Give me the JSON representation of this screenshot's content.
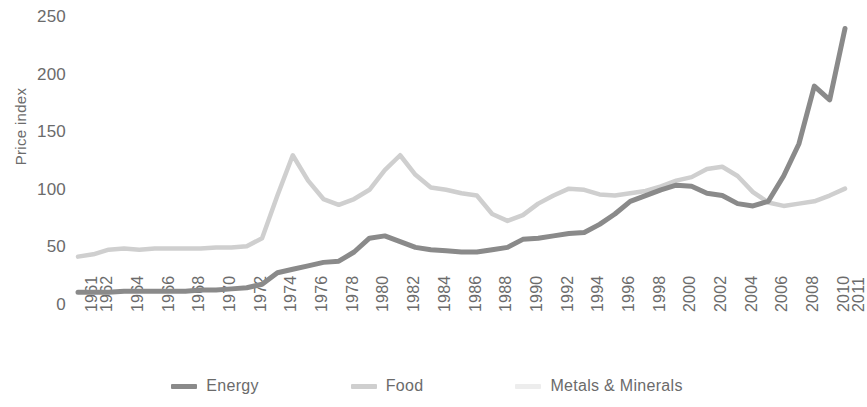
{
  "chart_data": {
    "type": "line",
    "title": "",
    "xlabel": "",
    "ylabel": "Price index",
    "ylim": [
      0,
      250
    ],
    "yticks": [
      0,
      50,
      100,
      150,
      200,
      250
    ],
    "grid": false,
    "legend_position": "bottom",
    "x": [
      1961,
      1962,
      1963,
      1964,
      1965,
      1966,
      1967,
      1968,
      1969,
      1970,
      1971,
      1972,
      1973,
      1974,
      1975,
      1976,
      1977,
      1978,
      1979,
      1980,
      1981,
      1982,
      1983,
      1984,
      1985,
      1986,
      1987,
      1988,
      1989,
      1990,
      1991,
      1992,
      1993,
      1994,
      1995,
      1996,
      1997,
      1998,
      1999,
      2000,
      2001,
      2002,
      2003,
      2004,
      2005,
      2006,
      2007,
      2008,
      2009,
      2010,
      2011
    ],
    "xtick_labels": [
      "1961",
      "1962",
      "1964",
      "1966",
      "1968",
      "1970",
      "1972",
      "1974",
      "1976",
      "1978",
      "1980",
      "1982",
      "1984",
      "1986",
      "1988",
      "1990",
      "1992",
      "1994",
      "1996",
      "1998",
      "2000",
      "2002",
      "2004",
      "2006",
      "2008",
      "2010",
      "2011"
    ],
    "series": [
      {
        "name": "Energy",
        "color": "#8a8a8a",
        "values": [
          11,
          11,
          11,
          12,
          12,
          12,
          12,
          12,
          13,
          13,
          14,
          15,
          18,
          28,
          31,
          34,
          37,
          38,
          46,
          58,
          60,
          55,
          50,
          48,
          47,
          46,
          46,
          48,
          50,
          57,
          58,
          60,
          62,
          63,
          70,
          79,
          90,
          95,
          100,
          104,
          103,
          97,
          95,
          88,
          86,
          90,
          112,
          140,
          190,
          178,
          240
        ]
      },
      {
        "name": "Food",
        "color": "#cfcfcf",
        "values": [
          42,
          44,
          48,
          49,
          48,
          49,
          49,
          49,
          49,
          50,
          50,
          51,
          58,
          95,
          130,
          108,
          92,
          87,
          92,
          100,
          117,
          130,
          113,
          102,
          100,
          97,
          95,
          79,
          73,
          78,
          88,
          95,
          101,
          100,
          96,
          95,
          97,
          99,
          103,
          108,
          111,
          118,
          120,
          112,
          98,
          89,
          86,
          88,
          90,
          95,
          101
        ]
      },
      {
        "name": "Metals & Minerals",
        "color": "#ececec",
        "values": [
          null,
          null,
          null,
          null,
          null,
          null,
          null,
          null,
          null,
          null,
          null,
          null,
          null,
          null,
          null,
          null,
          null,
          null,
          null,
          null,
          null,
          null,
          null,
          null,
          null,
          null,
          null,
          null,
          null,
          null,
          null,
          null,
          null,
          null,
          null,
          null,
          null,
          null,
          null,
          null,
          null,
          null,
          null,
          null,
          null,
          null,
          null,
          null,
          null,
          null,
          null
        ]
      }
    ],
    "food_actual": [
      42,
      44,
      48,
      49,
      48,
      49,
      49,
      49,
      49,
      50,
      50,
      51,
      58,
      95,
      130,
      108,
      92,
      87,
      92,
      100,
      117,
      130,
      113,
      102,
      100,
      97,
      95,
      79,
      73,
      78,
      88,
      95,
      101,
      100,
      96,
      95,
      97,
      99,
      103,
      108,
      111,
      118,
      120,
      112,
      98,
      89,
      86,
      88,
      90,
      95,
      101
    ]
  },
  "legend": {
    "items": [
      {
        "label": "Energy",
        "color": "#8a8a8a"
      },
      {
        "label": "Food",
        "color": "#cfcfcf"
      },
      {
        "label": "Metals & Minerals",
        "color": "#ededed"
      }
    ]
  },
  "axes": {
    "y_title": "Price index"
  }
}
